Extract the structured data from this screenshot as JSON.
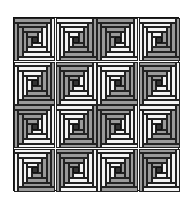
{
  "grid": {
    "rows": 4,
    "cols": 4,
    "x": 13,
    "y": 17,
    "width": 166,
    "height": 174
  },
  "colors": {
    "dark_log": "#9a9a9a",
    "light_log": "#f4f4f4",
    "center": "#333333",
    "outline": "#222222"
  },
  "block_structure": {
    "rings": 4,
    "center_fraction": 0.14
  },
  "blocks": [
    [
      "dark-top-left",
      "light-top-left",
      "dark-top-left",
      "light-top-left"
    ],
    [
      "light-top-left",
      "dark-top-left",
      "light-top-left",
      "dark-top-left"
    ],
    [
      "dark-top-left",
      "light-top-left",
      "dark-top-left",
      "light-top-left"
    ],
    [
      "light-top-left",
      "dark-top-left",
      "light-top-left",
      "dark-top-left"
    ]
  ]
}
